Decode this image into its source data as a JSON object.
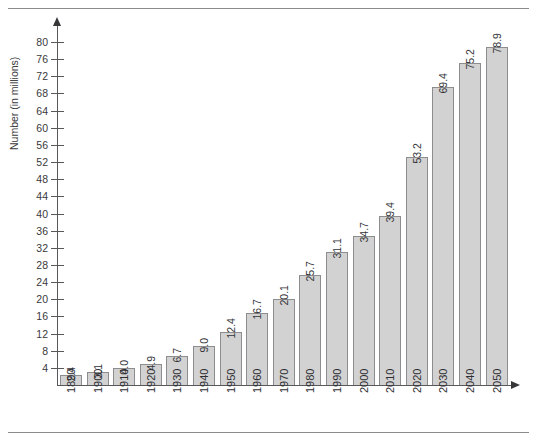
{
  "chart_data": {
    "type": "bar",
    "title": "",
    "subtitle": "",
    "xlabel": "",
    "ylabel": "Number (in millions)",
    "categories": [
      "1890",
      "1900",
      "1910",
      "1920",
      "1930",
      "1940",
      "1950",
      "1960",
      "1970",
      "1980",
      "1990",
      "2000",
      "2010",
      "2020",
      "2030",
      "2040",
      "2050"
    ],
    "values": [
      2.4,
      3.1,
      4.0,
      4.9,
      6.7,
      9.0,
      12.4,
      16.7,
      20.1,
      25.7,
      31.1,
      34.7,
      39.4,
      53.2,
      69.4,
      75.2,
      78.9
    ],
    "value_labels": [
      "2.4",
      "3.1",
      "4.0",
      "4.9",
      "6.7",
      "9.0",
      "12.4",
      "16.7",
      "20.1",
      "25.7",
      "31.1",
      "34.7",
      "39.4",
      "53.2",
      "69.4",
      "75.2",
      "78.9"
    ],
    "ylim": [
      0,
      82
    ],
    "ytick_values": [
      4,
      8,
      12,
      16,
      20,
      24,
      28,
      32,
      36,
      40,
      44,
      48,
      52,
      56,
      60,
      64,
      68,
      72,
      76,
      80
    ],
    "ytick_labels": [
      "4",
      "8",
      "12",
      "16",
      "20",
      "24",
      "28",
      "32",
      "36",
      "40",
      "44",
      "48",
      "52",
      "56",
      "60",
      "64",
      "68",
      "72",
      "76",
      "80"
    ],
    "ytick_step": 4,
    "grid": false,
    "legend": null,
    "legend_position": "none",
    "bar_fill_color": "#d2d2d2",
    "bar_border_color": "#8d8d8f",
    "axis_color": "#58585a",
    "text_color": "#3a3a3c",
    "background_color": "#ffffff",
    "value_label_rotation": 90,
    "category_label_rotation": 90,
    "y_axis_arrow": true,
    "x_axis_arrow": true
  },
  "page": {
    "top_rule": true,
    "bottom_rule": true,
    "rule_color": "#8a8a8a"
  }
}
